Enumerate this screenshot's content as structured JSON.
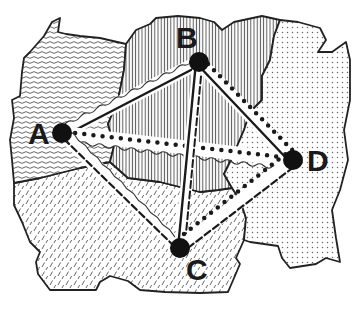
{
  "diagram": {
    "type": "map-graph",
    "colors": {
      "background": "#ffffff",
      "ink": "#1a1a1a",
      "hatch": "#555555"
    },
    "regions": [
      {
        "id": "northwest",
        "pattern": "wavy-horizontal"
      },
      {
        "id": "north-central",
        "pattern": "vertical-lines"
      },
      {
        "id": "east",
        "pattern": "dots"
      },
      {
        "id": "south",
        "pattern": "diagonal-dashes"
      }
    ],
    "nodes": [
      {
        "id": "A",
        "label": "A",
        "x": 62,
        "y": 133
      },
      {
        "id": "B",
        "label": "B",
        "x": 199,
        "y": 62
      },
      {
        "id": "C",
        "label": "C",
        "x": 180,
        "y": 248
      },
      {
        "id": "D",
        "label": "D",
        "x": 293,
        "y": 160
      }
    ],
    "edges": [
      {
        "from": "A",
        "to": "B",
        "styles": [
          "solid",
          "wavy"
        ]
      },
      {
        "from": "A",
        "to": "D",
        "styles": [
          "dotted",
          "wavy"
        ]
      },
      {
        "from": "A",
        "to": "C",
        "styles": [
          "dashed",
          "wavy"
        ]
      },
      {
        "from": "B",
        "to": "C",
        "styles": [
          "solid",
          "dashed"
        ]
      },
      {
        "from": "B",
        "to": "D",
        "styles": [
          "solid",
          "dotted"
        ]
      },
      {
        "from": "C",
        "to": "D",
        "styles": [
          "dashed",
          "dotted"
        ]
      }
    ]
  }
}
